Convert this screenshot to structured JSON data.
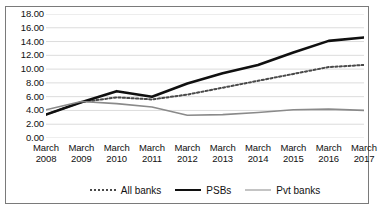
{
  "chart_data": {
    "type": "line",
    "title": "",
    "xlabel": "",
    "ylabel": "",
    "categories": [
      "March 2008",
      "March 2009",
      "March 2010",
      "March 2011",
      "March 2012",
      "March 2013",
      "March 2014",
      "March 2015",
      "March 2016",
      "March 2017"
    ],
    "x_tick_lines": [
      [
        "March",
        "2008"
      ],
      [
        "March",
        "2009"
      ],
      [
        "March",
        "2010"
      ],
      [
        "March",
        "2011"
      ],
      [
        "March",
        "2012"
      ],
      [
        "March",
        "2013"
      ],
      [
        "March",
        "2014"
      ],
      [
        "March",
        "2015"
      ],
      [
        "March",
        "2016"
      ],
      [
        "March",
        "2017"
      ]
    ],
    "y_ticks": [
      "18.00",
      "16.00",
      "14.00",
      "12.00",
      "10.00",
      "8.00",
      "6.00",
      "4.00",
      "2.00",
      "0.00"
    ],
    "ylim": [
      0,
      18
    ],
    "y_step": 2,
    "grid": true,
    "legend_position": "bottom-center",
    "series": [
      {
        "name": "All banks",
        "style": "dotted",
        "color": "#4a4a4a",
        "values": [
          3.4,
          5.2,
          5.9,
          5.6,
          6.3,
          7.3,
          8.3,
          9.3,
          10.3,
          10.6
        ]
      },
      {
        "name": "PSBs",
        "style": "solid-thick",
        "color": "#101010",
        "values": [
          3.4,
          5.2,
          6.8,
          6.0,
          7.9,
          9.4,
          10.6,
          12.4,
          14.1,
          14.6
        ]
      },
      {
        "name": "Pvt banks",
        "style": "solid-gray",
        "color": "#8a8a8a",
        "values": [
          4.1,
          5.3,
          5.0,
          4.5,
          3.3,
          3.4,
          3.7,
          4.1,
          4.2,
          4.0
        ]
      }
    ]
  },
  "legend": {
    "items": [
      {
        "label": "All banks"
      },
      {
        "label": "PSBs"
      },
      {
        "label": "Pvt banks"
      }
    ]
  }
}
